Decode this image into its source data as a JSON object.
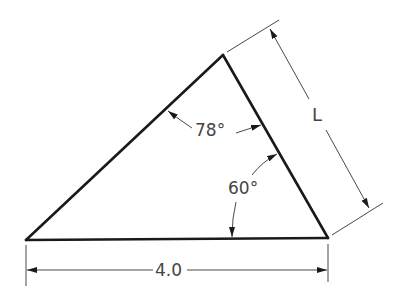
{
  "diagram": {
    "type": "triangle-dimension-drawing",
    "colors": {
      "edge": "#1a1a1a",
      "dimension": "#333333",
      "text": "#444444",
      "background": "#ffffff"
    },
    "vertices": {
      "bottom_left": [
        26,
        240
      ],
      "top": [
        223,
        55
      ],
      "bottom_right": [
        328,
        238
      ]
    },
    "labels": {
      "base_length": "4.0",
      "side_length": "L",
      "top_angle": "78°",
      "bottom_right_angle": "60°"
    },
    "dimensions": {
      "base": {
        "label": "4.0",
        "from": [
          26,
          270
        ],
        "to": [
          328,
          270
        ]
      },
      "side": {
        "label": "L",
        "from": [
          269,
          28
        ],
        "to": [
          370,
          209
        ]
      }
    },
    "angles": [
      {
        "label": "78°",
        "vertex": "top",
        "value_deg": 78
      },
      {
        "label": "60°",
        "vertex": "bottom_right",
        "value_deg": 60
      }
    ]
  }
}
